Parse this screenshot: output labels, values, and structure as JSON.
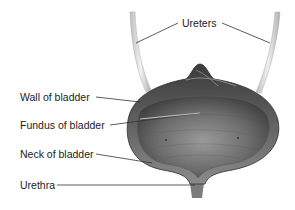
{
  "figure": {
    "labels": {
      "ureters": "Ureters",
      "wall": "Wall of bladder",
      "fundus": "Fundus of bladder",
      "neck": "Neck of bladder",
      "urethra": "Urethra"
    }
  },
  "colors": {
    "tissue_dark": "#4a4a4a",
    "tissue_mid": "#7a7a7a",
    "ureter": "#d8d8d8",
    "leader_line": "#333333"
  }
}
